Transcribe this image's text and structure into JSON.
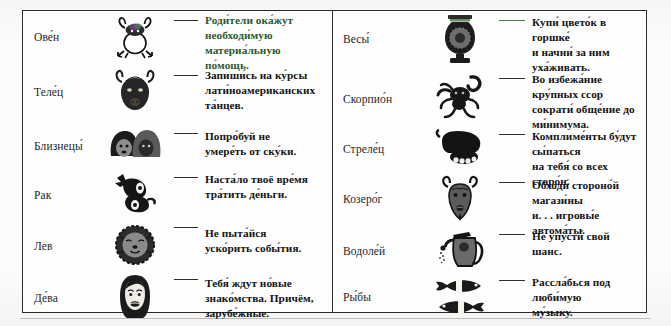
{
  "document": {
    "type": "horoscope-table",
    "columns": 2
  },
  "left_column": {
    "rows": [
      {
        "sign": "Ове́н",
        "icon": "aries-ram-icon",
        "dash_color": "#2f2f2f",
        "text_accent": true,
        "lines": [
          "Роди́тели ока́жут",
          "необходи́мую",
          "материа́льную по́мощь."
        ]
      },
      {
        "sign": "Теле́ц",
        "icon": "taurus-bull-icon",
        "dash_color": "#2f2f2f",
        "text_accent": false,
        "lines": [
          "Запиши́сь на ку́рсы",
          "лати́ноамериканских",
          "та́нцев."
        ]
      },
      {
        "sign": "Близнецы́",
        "icon": "gemini-twins-icon",
        "dash_color": "#2f2f2f",
        "text_accent": false,
        "lines": [
          "Попро́буй не",
          "умере́ть от ску́ки."
        ]
      },
      {
        "sign": "Рак",
        "icon": "cancer-crab-icon",
        "dash_color": "#2f2f2f",
        "text_accent": false,
        "lines": [
          "Наста́ло твоё вре́мя",
          "тра́тить де́ньги."
        ]
      },
      {
        "sign": "Лев",
        "icon": "leo-lion-icon",
        "dash_color": "#2f2f2f",
        "text_accent": false,
        "lines": [
          "Не пыта́йся",
          "уско́рить собы́тия."
        ]
      },
      {
        "sign": "Де́ва",
        "icon": "virgo-maiden-icon",
        "dash_color": "#2f2f2f",
        "text_accent": false,
        "lines": [
          "Тебя́ ждут но́вые",
          "знако́мства. Причём,",
          "зарубе́жные."
        ]
      }
    ]
  },
  "right_column": {
    "rows": [
      {
        "sign": "Весы́",
        "icon": "libra-scales-icon",
        "dash_color": "#4a7d4a",
        "text_accent": false,
        "lines": [
          "Купи́ цвето́к в горшке́",
          "и начни́ за ним уха́живать."
        ]
      },
      {
        "sign": "Скорпио́н",
        "icon": "scorpio-scorpion-icon",
        "dash_color": "#2f2f2f",
        "text_accent": false,
        "lines": [
          "Во избежа́ние кру́пных ссор",
          "сократи́ обще́ние до",
          "ми́нимума."
        ]
      },
      {
        "sign": "Стреле́ц",
        "icon": "sagittarius-centaur-icon",
        "dash_color": "#2f2f2f",
        "text_accent": false,
        "lines": [
          "Комплиме́нты бу́дут сы́паться",
          "на тебя́ со всех сторо́н."
        ]
      },
      {
        "sign": "Козеро́г",
        "icon": "capricorn-goat-icon",
        "dash_color": "#2f2f2f",
        "text_accent": false,
        "lines": [
          "Обходи́ стороно́й магази́ны",
          "и. . . игровы́е автома́ты."
        ]
      },
      {
        "sign": "Водоле́й",
        "icon": "aquarius-watering-can-icon",
        "dash_color": "#2f2f2f",
        "text_accent": false,
        "lines": [
          "Не упусти́ свой шанс."
        ]
      },
      {
        "sign": "Ры́бы",
        "icon": "pisces-fish-icon",
        "dash_color": "#2f2f2f",
        "text_accent": false,
        "lines": [
          "Рассла́бься под люби́мую",
          "му́зыку."
        ]
      }
    ]
  },
  "colors": {
    "ink": "#141414",
    "rule": "#2b2b2b",
    "accent_green": "#2d5a2d",
    "paper": "#fbfaf8"
  }
}
